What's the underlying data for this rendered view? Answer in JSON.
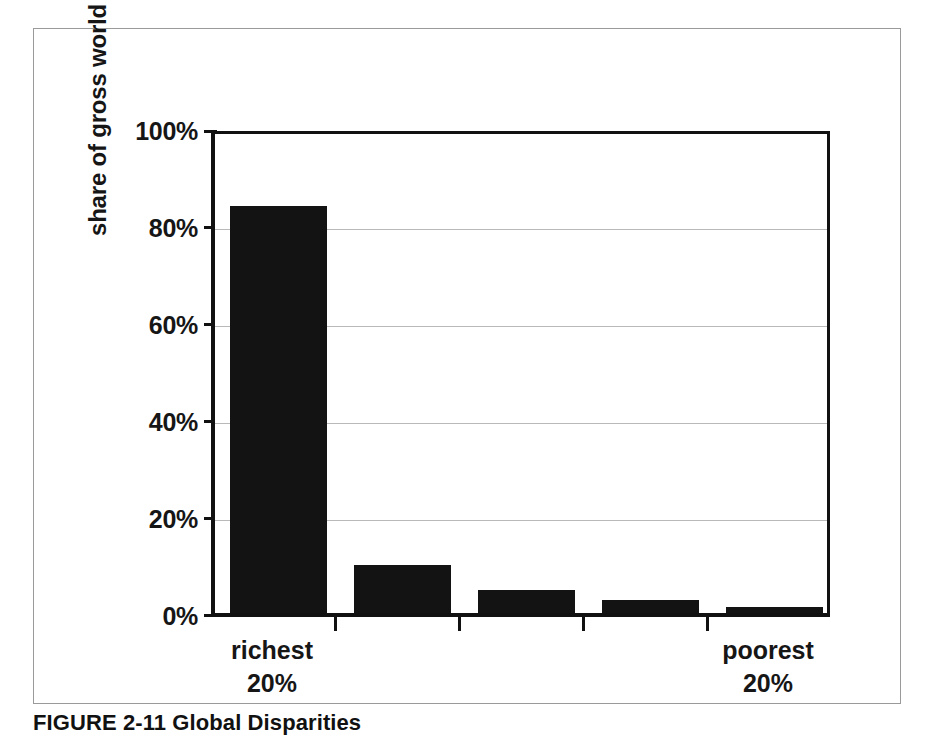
{
  "figure": {
    "caption": "FIGURE 2-11 Global Disparities"
  },
  "chart_data": {
    "type": "bar",
    "title": "",
    "subtitle": "",
    "xlabel": "",
    "ylabel": "share of gross world product",
    "categories": [
      "richest 20%",
      "",
      "",
      "",
      "poorest 20%"
    ],
    "category_labels": [
      {
        "line1": "richest",
        "line2": "20%"
      },
      {
        "line1": "",
        "line2": ""
      },
      {
        "line1": "",
        "line2": ""
      },
      {
        "line1": "",
        "line2": ""
      },
      {
        "line1": "poorest",
        "line2": "20%"
      }
    ],
    "values": [
      85,
      10,
      4.7,
      2.7,
      1.2
    ],
    "value_unit": "%",
    "ylim": [
      0,
      100
    ],
    "ytick_labels": [
      "100%",
      "80%",
      "60%",
      "40%",
      "20%",
      "0%"
    ],
    "ytick_values": [
      100,
      80,
      60,
      40,
      20,
      0
    ],
    "grid": true,
    "grid_axis": "y",
    "legend": "none",
    "bar_color": "#131313",
    "grid_color": "#b9b9b9",
    "axis_color": "#111111",
    "background_color": "#ffffff"
  }
}
